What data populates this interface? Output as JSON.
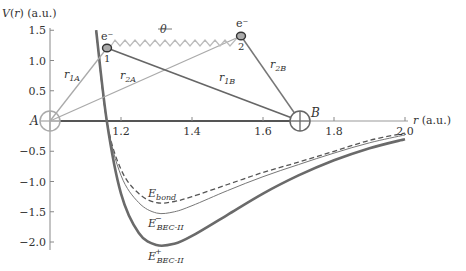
{
  "chart_data": {
    "type": "line",
    "title": "",
    "xlabel": "r (a.u.)",
    "ylabel": "V(r) (a.u.)",
    "xlim": [
      1.0,
      2.0
    ],
    "ylim": [
      -2.1,
      1.5
    ],
    "xticks": [
      "1.2",
      "1.4",
      "1.6",
      "1.8",
      "2.0"
    ],
    "yticks": [
      "1.5",
      "1.0",
      "0.5",
      "-0.5",
      "-1.0",
      "-1.5",
      "-2.0"
    ],
    "grid": false,
    "legend": "inline labels",
    "series": [
      {
        "name": "E_bond",
        "label_main": "E",
        "label_sub": "bond",
        "label_sup": "",
        "style": "dashed",
        "color": "#555555",
        "x": [
          1.13,
          1.16,
          1.2,
          1.25,
          1.3,
          1.35,
          1.4,
          1.5,
          1.6,
          1.7,
          1.8,
          1.9,
          2.0
        ],
        "y": [
          1.5,
          0.0,
          -0.8,
          -1.2,
          -1.35,
          -1.33,
          -1.25,
          -1.05,
          -0.85,
          -0.68,
          -0.5,
          -0.32,
          -0.2
        ]
      },
      {
        "name": "E_BEC-II minus",
        "label_main": "E",
        "label_sub": "BEC-II",
        "label_sup": "−",
        "style": "solid-thin",
        "color": "#777777",
        "x": [
          1.13,
          1.16,
          1.2,
          1.25,
          1.3,
          1.35,
          1.4,
          1.5,
          1.6,
          1.7,
          1.8,
          1.9,
          2.0
        ],
        "y": [
          1.5,
          0.0,
          -0.9,
          -1.35,
          -1.52,
          -1.5,
          -1.4,
          -1.15,
          -0.92,
          -0.72,
          -0.53,
          -0.36,
          -0.23
        ]
      },
      {
        "name": "E_BEC-II plus",
        "label_main": "E",
        "label_sub": "BEC-II",
        "label_sup": "+",
        "style": "solid-thick",
        "color": "#6a6a6a",
        "x": [
          1.13,
          1.16,
          1.2,
          1.25,
          1.3,
          1.35,
          1.4,
          1.5,
          1.6,
          1.7,
          1.8,
          1.9,
          2.0
        ],
        "y": [
          1.5,
          0.0,
          -1.2,
          -1.85,
          -2.05,
          -2.03,
          -1.9,
          -1.55,
          -1.2,
          -0.9,
          -0.65,
          -0.45,
          -0.3
        ]
      }
    ],
    "annotations": {
      "nucleus_A": {
        "label": "A",
        "r": 1.0,
        "v": 0.0
      },
      "nucleus_B": {
        "label": "B",
        "r": 1.7,
        "v": 0.0
      },
      "electron_1": {
        "label": "e⁻",
        "index": "1",
        "r": 1.16,
        "v": 1.22
      },
      "electron_2": {
        "label": "e⁻",
        "index": "2",
        "r": 1.535,
        "v": 1.42
      },
      "distances": [
        {
          "name": "r_1A",
          "main": "r",
          "sub": "1A"
        },
        {
          "name": "r_2A",
          "main": "r",
          "sub": "2A"
        },
        {
          "name": "r_1B",
          "main": "r",
          "sub": "1B"
        },
        {
          "name": "r_2B",
          "main": "r",
          "sub": "2B"
        }
      ],
      "spring_label": "θ"
    }
  }
}
